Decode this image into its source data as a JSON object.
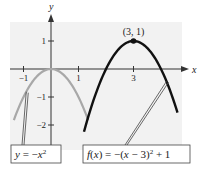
{
  "chart_data": {
    "type": "line",
    "title": "",
    "xlabel": "x",
    "ylabel": "y",
    "xlim": [
      -1.6,
      4.9
    ],
    "ylim": [
      -2.9,
      1.9
    ],
    "grid": false,
    "x_ticks": [
      {
        "value": -1,
        "label": "−1"
      },
      {
        "value": 1,
        "label": "1"
      },
      {
        "value": 3,
        "label": "3"
      }
    ],
    "y_ticks": [
      {
        "value": 1,
        "label": "1"
      },
      {
        "value": -1,
        "label": "−1"
      },
      {
        "value": -2,
        "label": "−2"
      }
    ],
    "series": [
      {
        "name": "y = -x^2",
        "equation": "y = −x²",
        "color": "#a8a8a8",
        "h": 0,
        "k": 0,
        "x_range": [
          -1.35,
          1.35
        ]
      },
      {
        "name": "f(x) = -(x - 3)^2 + 1",
        "equation": "f(x) = −(x − 3)² + 1",
        "color": "#111111",
        "h": 3,
        "k": 1,
        "x_range": [
          1.2,
          4.6
        ]
      }
    ],
    "annotations": [
      {
        "label": "(3, 1)",
        "x": 3,
        "y": 1,
        "marker": "point"
      }
    ],
    "callouts": [
      {
        "series": 0,
        "text_parts": [
          "y",
          " = −",
          "x",
          "2"
        ],
        "anchor_x": -0.9
      },
      {
        "series": 1,
        "text_parts": [
          "f",
          "(",
          "x",
          ") = −(",
          "x",
          " − 3)",
          "2",
          " + 1"
        ],
        "anchor_x": 4.2
      }
    ]
  }
}
